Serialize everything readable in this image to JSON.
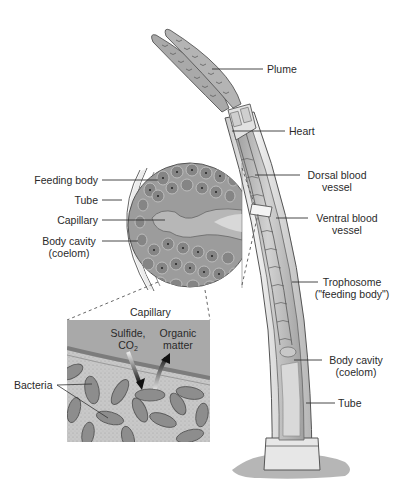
{
  "diagram": {
    "worm_labels": {
      "plume": "Plume",
      "heart": "Heart",
      "dorsal_vessel_1": "Dorsal blood",
      "dorsal_vessel_2": "vessel",
      "ventral_vessel_1": "Ventral blood",
      "ventral_vessel_2": "vessel",
      "trophosome_1": "Trophosome",
      "trophosome_2": "(\"feeding body\")",
      "body_cavity_1": "Body cavity",
      "body_cavity_2": "(coelom)",
      "tube": "Tube"
    },
    "cross_section_labels": {
      "feeding_body": "Feeding body",
      "tube": "Tube",
      "capillary": "Capillary",
      "body_cavity_1": "Body cavity",
      "body_cavity_2": "(coelom)"
    },
    "detail_labels": {
      "capillary": "Capillary",
      "sulfide_1": "Sulfide,",
      "sulfide_2": "CO",
      "sulfide_sub": "2",
      "organic_1": "Organic",
      "organic_2": "matter",
      "bacteria": "Bacteria"
    },
    "colors": {
      "tissue_gray": "#a8a8a8",
      "cell_dark": "#7d7d7d",
      "capillary_fill": "#b9b9b9",
      "tube_light": "#e6e6e6",
      "line": "#333333"
    }
  }
}
